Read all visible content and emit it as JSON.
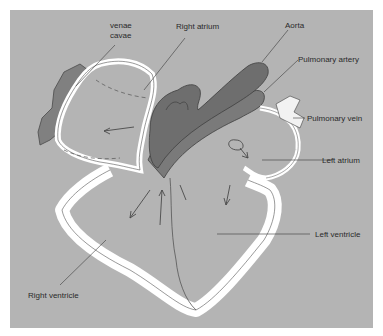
{
  "figure": {
    "type": "anatomical-diagram",
    "background_color": "#b4b4b4",
    "vessel_color": "#7a7a7a",
    "wall_color": "#ffffff",
    "labels": {
      "venae_cavae_line1": "venae",
      "venae_cavae_line2": "cavae",
      "right_atrium": "Right atrium",
      "aorta": "Aorta",
      "pulmonary_artery": "Pulmonary artery",
      "pulmonary_vein": "Pulmonary vein",
      "left_atrium": "Left atrium",
      "left_ventricle": "Left ventricle",
      "right_ventricle": "Right ventricle"
    }
  }
}
